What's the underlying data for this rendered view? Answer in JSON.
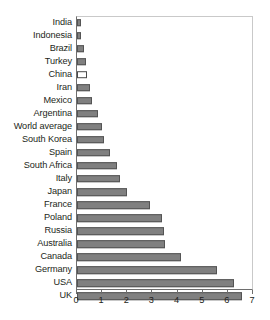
{
  "chart_data": {
    "type": "bar",
    "orientation": "horizontal",
    "title": "",
    "subtitle": "",
    "xlabel": "",
    "ylabel": "",
    "xlim": [
      0,
      7
    ],
    "xticks": [
      "0",
      "1",
      "2",
      "3",
      "4",
      "5",
      "6",
      "7"
    ],
    "grid": false,
    "legend": "none",
    "bar_color": "#808080",
    "bar_edge_color": "#545454",
    "highlight_color": "#ffffff",
    "categories": [
      "India",
      "Indonesia",
      "Brazil",
      "Turkey",
      "China",
      "Iran",
      "Mexico",
      "Argentina",
      "World average",
      "South Korea",
      "Spain",
      "South Africa",
      "Italy",
      "Japan",
      "France",
      "Poland",
      "Russia",
      "Australia",
      "Canada",
      "Germany",
      "USA",
      "UK"
    ],
    "values": [
      0.15,
      0.15,
      0.28,
      0.37,
      0.38,
      0.5,
      0.6,
      0.82,
      1.0,
      1.07,
      1.33,
      1.6,
      1.7,
      2.0,
      2.9,
      3.4,
      3.45,
      3.5,
      4.15,
      5.55,
      6.25,
      6.55
    ],
    "styles": [
      "filled",
      "filled",
      "filled",
      "filled",
      "hollow",
      "filled",
      "filled",
      "filled",
      "filled",
      "filled",
      "filled",
      "filled",
      "filled",
      "filled",
      "filled",
      "filled",
      "filled",
      "filled",
      "filled",
      "filled",
      "filled",
      "filled"
    ]
  }
}
